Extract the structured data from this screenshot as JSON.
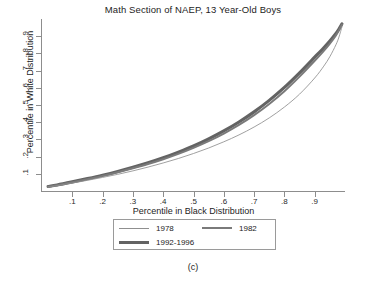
{
  "figure": {
    "caption": "(c)"
  },
  "chart_data": {
    "type": "line",
    "title": "Math Section of NAEP, 13 Year-Old Boys",
    "xlabel": "Percentile in Black Distribution",
    "ylabel": "Percentile in White Distribution",
    "xlim": [
      0.0,
      1.0
    ],
    "ylim": [
      0.0,
      1.0
    ],
    "grid": false,
    "legend_position": "below-axes",
    "xticks": [
      0.1,
      0.2,
      0.3,
      0.4,
      0.5,
      0.6,
      0.7,
      0.8,
      0.9
    ],
    "xticklabels": [
      ".1",
      ".2",
      ".3",
      ".4",
      ".5",
      ".6",
      ".7",
      ".8",
      ".9"
    ],
    "yticks": [
      0.1,
      0.2,
      0.3,
      0.4,
      0.5,
      0.6,
      0.7,
      0.8,
      0.9
    ],
    "yticklabels": [
      ".1",
      ".2",
      ".3",
      ".4",
      ".5",
      ".6",
      ".7",
      ".8",
      ".9"
    ],
    "x": [
      0.02,
      0.05,
      0.1,
      0.15,
      0.2,
      0.25,
      0.3,
      0.35,
      0.4,
      0.45,
      0.5,
      0.55,
      0.6,
      0.65,
      0.7,
      0.75,
      0.8,
      0.85,
      0.9,
      0.93,
      0.95,
      0.97,
      0.98,
      0.99
    ],
    "series": [
      {
        "name": "1978",
        "color": "#8f8f8f",
        "linewidth": "thin",
        "values": [
          0.023,
          0.031,
          0.046,
          0.062,
          0.079,
          0.097,
          0.117,
          0.139,
          0.163,
          0.189,
          0.218,
          0.25,
          0.286,
          0.326,
          0.372,
          0.425,
          0.488,
          0.563,
          0.657,
          0.726,
          0.781,
          0.85,
          0.895,
          0.955
        ]
      },
      {
        "name": "1982",
        "color": "#7a7a7a",
        "linewidth": "medium",
        "values": [
          0.025,
          0.034,
          0.051,
          0.069,
          0.088,
          0.109,
          0.132,
          0.157,
          0.185,
          0.216,
          0.251,
          0.29,
          0.334,
          0.384,
          0.441,
          0.506,
          0.58,
          0.665,
          0.757,
          0.815,
          0.857,
          0.905,
          0.934,
          0.968
        ]
      },
      {
        "name": "1992-1996",
        "color": "#636363",
        "linewidth": "thick",
        "values": [
          0.026,
          0.035,
          0.053,
          0.072,
          0.092,
          0.114,
          0.138,
          0.164,
          0.193,
          0.226,
          0.262,
          0.303,
          0.349,
          0.401,
          0.46,
          0.527,
          0.602,
          0.687,
          0.778,
          0.833,
          0.872,
          0.916,
          0.942,
          0.972
        ]
      }
    ]
  }
}
